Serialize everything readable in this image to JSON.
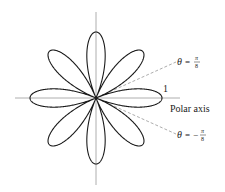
{
  "diagram": {
    "type": "polar-rose",
    "equation": "r = cos 4θ",
    "petals": 8,
    "unit_radius_px": 66,
    "center": [
      96,
      98
    ],
    "labels": {
      "radius_one": "1",
      "polar_axis": "Polar axis",
      "theta_upper": "θ = π/8",
      "theta_lower": "θ = −π/8",
      "theta_symbol": "θ",
      "equals": "=",
      "minus": "−",
      "pi": "π",
      "eight": "8"
    },
    "colors": {
      "curve": "#1a1a1a",
      "axis": "#9a9a9a",
      "dashed": "#8a8a8a",
      "text": "#222222"
    }
  }
}
